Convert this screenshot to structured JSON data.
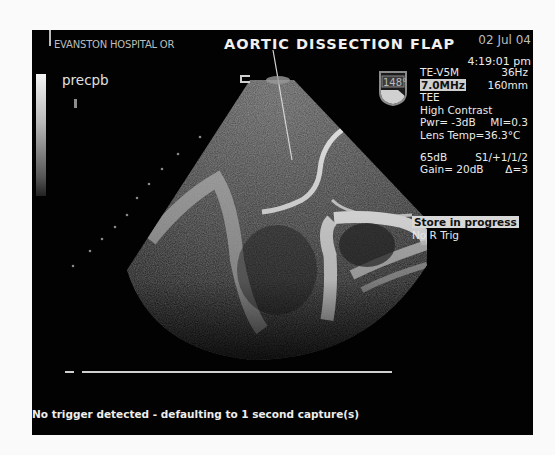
{
  "header": {
    "institution": "EVANSTON HOSPITAL OR",
    "title": "AORTIC DISSECTION FLAP",
    "date": "02 Jul 04",
    "time": "4:19:01 pm"
  },
  "study_label": "precpb",
  "probe": {
    "angle": "148°",
    "icon": "probe-angle-icon"
  },
  "settings": {
    "transducer": "TE-V5M",
    "frame_rate": "36Hz",
    "frequency": "7.0MHz",
    "depth": "160mm",
    "mode": "TEE",
    "preset": "High Contrast",
    "power": "Pwr= -3dB",
    "mi": "MI=0.3",
    "lens_temp": "Lens Temp=36.3°C",
    "dynamic_range": "65dB",
    "processing": "S1/+1/1/2",
    "gain": "Gain= 20dB",
    "delta": "Δ=3"
  },
  "status": {
    "store": "Store in progress",
    "trigger": "No R Trig"
  },
  "footer": {
    "message": "No trigger detected - defaulting to 1 second capture(s)"
  },
  "colors": {
    "background": "#020202",
    "text": "#e6e6e6",
    "highlight": "#cfcfcf"
  }
}
